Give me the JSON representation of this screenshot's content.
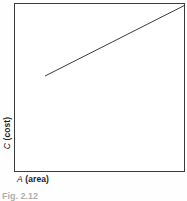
{
  "figure": {
    "caption": "Fig. 2.12"
  },
  "axes": {
    "x": {
      "symbol": "A",
      "name": "(area)"
    },
    "y": {
      "symbol": "C",
      "name": "(cost)"
    }
  },
  "chart_data": {
    "type": "line",
    "title": "",
    "subtitle": "",
    "xlabel": "A (area)",
    "ylabel": "C (cost)",
    "xlim": [
      0,
      100
    ],
    "ylim": [
      0,
      100
    ],
    "grid": false,
    "legend": null,
    "axis_ticks": {
      "x": [],
      "y": []
    },
    "annotations": [],
    "series": [
      {
        "name": "cost vs area",
        "color": "#262626",
        "line_width": 1.4,
        "markers": false,
        "x": [
          18,
          100
        ],
        "y": [
          57,
          99
        ]
      }
    ]
  }
}
